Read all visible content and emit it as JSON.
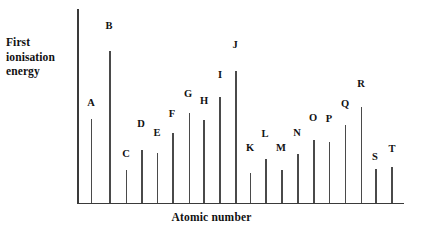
{
  "chart_data": {
    "type": "bar",
    "title": "",
    "subtitle": "",
    "xlabel": "Atomic number",
    "ylabel": "First ionisation energy",
    "ylabel_lines": [
      "First",
      "ionisation",
      "energy"
    ],
    "grid": false,
    "legend": null,
    "axis_ticks": false,
    "axis_tick_labels": false,
    "categories": [
      "A",
      "B",
      "C",
      "D",
      "E",
      "F",
      "G",
      "H",
      "I",
      "J",
      "K",
      "L",
      "M",
      "N",
      "O",
      "P",
      "Q",
      "R",
      "S",
      "T"
    ],
    "values": [
      85,
      152,
      33,
      53,
      50,
      70,
      90,
      83,
      106,
      132,
      30,
      44,
      34,
      49,
      63,
      61,
      79,
      96,
      34,
      36
    ],
    "ylim": [
      0,
      200
    ],
    "value_units": "arbitrary (unlabelled axis)",
    "points": [
      {
        "label": "A",
        "x_px": 90.5,
        "top_px": 119.0,
        "label_x_px": 84,
        "label_y_px": 98
      },
      {
        "label": "B",
        "x_px": 109.0,
        "top_px": 51.0,
        "label_x_px": 102,
        "label_y_px": 21
      },
      {
        "label": "C",
        "x_px": 125.5,
        "top_px": 170.0,
        "label_x_px": 119,
        "label_y_px": 149
      },
      {
        "label": "D",
        "x_px": 141.0,
        "top_px": 150.0,
        "label_x_px": 134,
        "label_y_px": 119
      },
      {
        "label": "E",
        "x_px": 156.5,
        "top_px": 152.5,
        "label_x_px": 150,
        "label_y_px": 128
      },
      {
        "label": "F",
        "x_px": 172.0,
        "top_px": 133.0,
        "label_x_px": 165,
        "label_y_px": 109
      },
      {
        "label": "G",
        "x_px": 188.5,
        "top_px": 113.0,
        "label_x_px": 181,
        "label_y_px": 89
      },
      {
        "label": "H",
        "x_px": 203.0,
        "top_px": 120.0,
        "label_x_px": 197,
        "label_y_px": 96
      },
      {
        "label": "I",
        "x_px": 219.0,
        "top_px": 97.0,
        "label_x_px": 213,
        "label_y_px": 70
      },
      {
        "label": "J",
        "x_px": 235.0,
        "top_px": 70.5,
        "label_x_px": 228,
        "label_y_px": 40
      },
      {
        "label": "K",
        "x_px": 249.5,
        "top_px": 173.0,
        "label_x_px": 243,
        "label_y_px": 143
      },
      {
        "label": "L",
        "x_px": 265.0,
        "top_px": 159.0,
        "label_x_px": 258,
        "label_y_px": 129
      },
      {
        "label": "M",
        "x_px": 281.0,
        "top_px": 169.5,
        "label_x_px": 274,
        "label_y_px": 143
      },
      {
        "label": "N",
        "x_px": 297.0,
        "top_px": 154.0,
        "label_x_px": 290,
        "label_y_px": 128
      },
      {
        "label": "O",
        "x_px": 313.0,
        "top_px": 140.0,
        "label_x_px": 306,
        "label_y_px": 113
      },
      {
        "label": "P",
        "x_px": 328.5,
        "top_px": 141.5,
        "label_x_px": 322,
        "label_y_px": 114
      },
      {
        "label": "Q",
        "x_px": 344.5,
        "top_px": 124.5,
        "label_x_px": 338,
        "label_y_px": 99
      },
      {
        "label": "R",
        "x_px": 360.5,
        "top_px": 107.0,
        "label_x_px": 354,
        "label_y_px": 79
      },
      {
        "label": "S",
        "x_px": 375.0,
        "top_px": 169.0,
        "label_x_px": 368,
        "label_y_px": 152
      },
      {
        "label": "T",
        "x_px": 391.0,
        "top_px": 166.5,
        "label_x_px": 385,
        "label_y_px": 144
      }
    ]
  },
  "colors": {
    "background": "#ffffff",
    "axis": "#3a3a3a",
    "bar": "#4a4a4a",
    "text": "#111111"
  }
}
